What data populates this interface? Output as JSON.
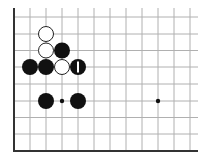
{
  "board": {
    "description": "Go board fragment (lower-left corner region)",
    "columns_x": [
      14,
      30,
      46,
      62,
      78,
      94,
      110,
      126,
      142,
      158,
      174,
      190
    ],
    "rows_y": [
      17,
      34,
      50.5,
      67,
      84,
      101,
      117.5,
      134,
      151
    ],
    "line_top": 8,
    "line_right": 198,
    "left_edge_x": 14,
    "bottom_edge_y": 151,
    "grid_color": "#b0b0b0",
    "edge_color": "#333333",
    "star_points": [
      {
        "col": 3,
        "row": 5
      },
      {
        "col": 9,
        "row": 5
      }
    ],
    "stones": [
      {
        "color": "white",
        "col": 2,
        "row": 1
      },
      {
        "color": "white",
        "col": 2,
        "row": 2
      },
      {
        "color": "black",
        "col": 3,
        "row": 2
      },
      {
        "color": "black",
        "col": 1,
        "row": 3
      },
      {
        "color": "black",
        "col": 2,
        "row": 3
      },
      {
        "color": "white",
        "col": 3,
        "row": 3
      },
      {
        "color": "black",
        "col": 4,
        "row": 3,
        "mark": "last-move-bar"
      },
      {
        "color": "black",
        "col": 2,
        "row": 5
      },
      {
        "color": "black",
        "col": 4,
        "row": 5
      }
    ],
    "stone_radius": 8
  }
}
